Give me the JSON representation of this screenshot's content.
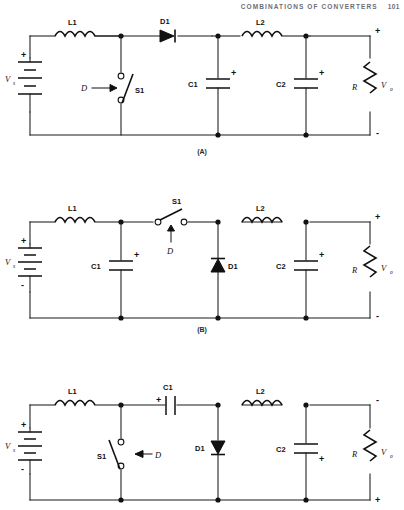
{
  "header": {
    "title": "COMBINATIONS OF CONVERTERS",
    "page_number": "101"
  },
  "figures": [
    {
      "id": "A",
      "caption": "(A)",
      "topology": "buck-boost cascade with series switch",
      "labels": {
        "source": "V",
        "source_sub": "s",
        "source_plus": "+",
        "source_minus": "-",
        "inductor1": "L1",
        "inductor2": "L2",
        "diode1": "D1",
        "switch1": "S1",
        "duty": "D",
        "cap1": "C1",
        "cap1_plus": "+",
        "cap2": "C2",
        "cap2_plus": "+",
        "resistor": "R",
        "output": "V",
        "output_sub": "o",
        "out_plus": "+",
        "out_minus": "-"
      }
    },
    {
      "id": "B",
      "caption": "(B)",
      "topology": "series switch with shunt diode",
      "labels": {
        "source": "V",
        "source_sub": "s",
        "source_plus": "+",
        "source_minus": "-",
        "inductor1": "L1",
        "inductor2": "L2",
        "diode1": "D1",
        "switch1": "S1",
        "duty": "D",
        "cap1": "C1",
        "cap1_plus": "+",
        "cap2": "C2",
        "cap2_plus": "+",
        "resistor": "R",
        "output": "V",
        "output_sub": "o",
        "out_plus": "+",
        "out_minus": "-"
      }
    },
    {
      "id": "C",
      "caption": "",
      "topology": "Cuk converter with coupling capacitor and inverted output",
      "labels": {
        "source": "V",
        "source_sub": "s",
        "source_plus": "+",
        "source_minus": "-",
        "inductor1": "L1",
        "inductor2": "L2",
        "diode1": "D1",
        "switch1": "S1",
        "duty": "D",
        "cap1": "C1",
        "cap1_plus": "+",
        "cap2": "C2",
        "cap2_plus": "+",
        "resistor": "R",
        "output": "V",
        "output_sub": "o",
        "out_plus": "+",
        "out_minus": "-"
      }
    }
  ],
  "captions": {
    "a": "(A)",
    "b": "(B)"
  },
  "colors": {
    "ink": "#1a1a1a",
    "header": "#6d6d78",
    "background": "#ffffff"
  }
}
